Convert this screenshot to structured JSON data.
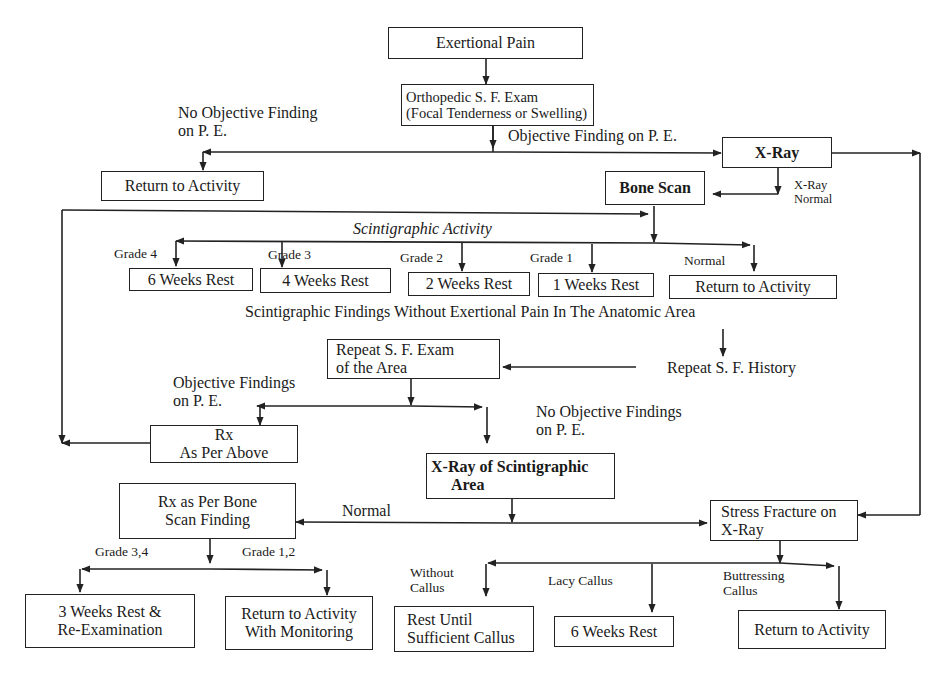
{
  "diagram": {
    "type": "clinical-flowchart",
    "topic": "stress fracture evaluation",
    "nodes": {
      "exertional_pain": "Exertional Pain",
      "ortho_exam": {
        "line1": "Orthopedic S. F. Exam",
        "line2": "(Focal Tenderness or Swelling)"
      },
      "return_top": "Return to Activity",
      "xray": "X-Ray",
      "bone_scan": "Bone Scan",
      "rest_6": "6 Weeks Rest",
      "rest_4": "4 Weeks Rest",
      "rest_2": "2 Weeks Rest",
      "rest_1": "1 Weeks Rest",
      "return_normal": "Return to Activity",
      "repeat_exam": {
        "line1": "Repeat S. F. Exam",
        "line2": "of the Area"
      },
      "repeat_history": "Repeat S. F. History",
      "rx_above": {
        "line1": "Rx",
        "line2": "As Per Above"
      },
      "xray_scint": {
        "line1": "X-Ray of Scintigraphic",
        "line2": "Area"
      },
      "rx_bone_scan": {
        "line1": "Rx as Per Bone",
        "line2": "Scan Finding"
      },
      "stress_fracture": {
        "line1": "Stress Fracture on",
        "line2": "X-Ray"
      },
      "rest_3_reexam": {
        "line1": "3 Weeks Rest &",
        "line2": "Re-Examination"
      },
      "return_monitoring": {
        "line1": "Return to Activity",
        "line2": "With Monitoring"
      },
      "rest_until_callus": {
        "line1": "Rest Until",
        "line2": "Sufficient Callus"
      },
      "rest_6_callus": "6 Weeks Rest",
      "return_bottom": "Return to Activity"
    },
    "edge_labels": {
      "no_objective_pe": {
        "line1": "No Objective Finding",
        "line2": "on P. E."
      },
      "objective_pe": "Objective Finding on P. E.",
      "xray_normal": {
        "line1": "X-Ray",
        "line2": "Normal"
      },
      "scint_activity": "Scintigraphic Activity",
      "grade4": "Grade 4",
      "grade3": "Grade 3",
      "grade2": "Grade 2",
      "grade1": "Grade 1",
      "normal_scan": "Normal",
      "scint_no_pain": "Scintigraphic Findings Without Exertional Pain In The Anatomic Area",
      "objective_findings": {
        "line1": "Objective Findings",
        "line2": "on P. E."
      },
      "no_objective_findings": {
        "line1": "No Objective Findings",
        "line2": "on P. E."
      },
      "normal_xray2": "Normal",
      "grade_3_4": "Grade 3,4",
      "grade_1_2": "Grade 1,2",
      "without_callus": {
        "line1": "Without",
        "line2": "Callus"
      },
      "lacy_callus": "Lacy Callus",
      "buttressing_callus": {
        "line1": "Buttressing",
        "line2": "Callus"
      }
    },
    "colors": {
      "line": "#222222",
      "background": "#ffffff",
      "text": "#1a1a1a"
    }
  }
}
